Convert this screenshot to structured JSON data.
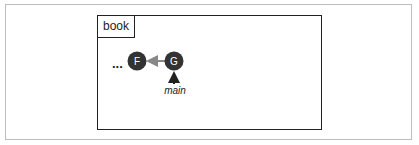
{
  "diagram": {
    "repository": {
      "label": "book"
    },
    "ellipsis": "...",
    "commits": [
      {
        "id": "F",
        "cx": 137,
        "cy": 61
      },
      {
        "id": "G",
        "cx": 174,
        "cy": 61
      }
    ],
    "edges": [
      {
        "from": "G",
        "to": "F",
        "color": "#888888"
      }
    ],
    "branch": {
      "label": "main",
      "points_to": "G"
    },
    "colors": {
      "node_fill": "#333333",
      "node_text": "#ffffff",
      "border": "#222222",
      "outer_border": "#bdbdbd"
    }
  }
}
